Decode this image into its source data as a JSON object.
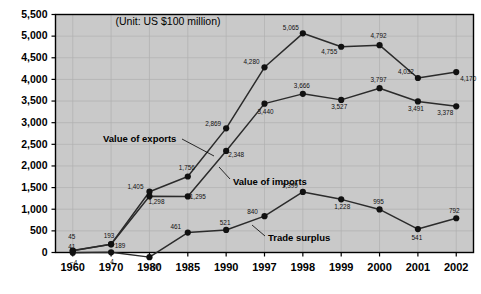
{
  "chart_data": {
    "type": "line",
    "title": "",
    "subtitle": "",
    "annotation": "(Unit:  US $100 million)",
    "xlabel": "",
    "ylabel": "",
    "categories": [
      "1960",
      "1970",
      "1980",
      "1985",
      "1990",
      "1997",
      "1998",
      "1999",
      "2000",
      "2001",
      "2002"
    ],
    "ylim": [
      0,
      5500
    ],
    "yticks": [
      0,
      500,
      1000,
      1500,
      2000,
      2500,
      3000,
      3500,
      4000,
      4500,
      5000,
      5500
    ],
    "ytick_labels": [
      "0",
      "500",
      "1,000",
      "1,500",
      "2,000",
      "2,500",
      "3,000",
      "3,500",
      "4,000",
      "4,500",
      "5,000",
      "5,500"
    ],
    "grid": true,
    "legend_position": "inline-annotations",
    "series": [
      {
        "name": "Value of exports",
        "values": [
          45,
          193,
          1405,
          1756,
          2869,
          4280,
          5065,
          4755,
          4792,
          4032,
          4170
        ],
        "labels": [
          "45",
          "193",
          "1,405",
          "1,756",
          "2,869",
          "4,280",
          "5,065",
          "4,755",
          "4,792",
          "4,032",
          "4,170"
        ]
      },
      {
        "name": "Value of imports",
        "values": [
          41,
          189,
          1298,
          1295,
          2348,
          3440,
          3666,
          3527,
          3797,
          3491,
          3378
        ],
        "labels": [
          "41",
          "189",
          "1,298",
          "1,295",
          "2,348",
          "3,440",
          "3,666",
          "3,527",
          "3,797",
          "3,491",
          "3,378"
        ]
      },
      {
        "name": "Trade surplus",
        "values": [
          -4,
          4,
          -107,
          461,
          521,
          840,
          1399,
          1228,
          995,
          541,
          792
        ],
        "labels": [
          "−4",
          "4",
          "−107",
          "461",
          "521",
          "840",
          "1,399",
          "1,228",
          "995",
          "541",
          "792"
        ]
      }
    ],
    "colors": {
      "plot_background": "#c9c9c9",
      "page_background": "#ffffff",
      "line": "#2b2b2b",
      "marker": "#111111",
      "grid": "#b0b0b0",
      "axis": "#000000",
      "text": "#000000"
    }
  },
  "labels": {
    "exports": "Value of exports",
    "imports": "Value of imports",
    "surplus": "Trade surplus"
  }
}
